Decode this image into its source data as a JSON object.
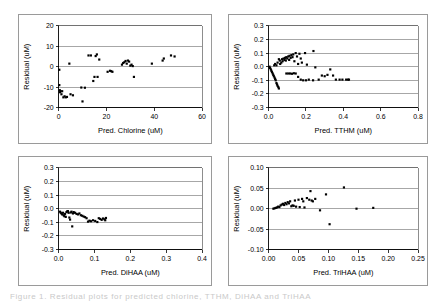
{
  "figure": {
    "background": "#ffffff",
    "marker_color": "#000000",
    "grid_color": "#7f7f7f",
    "axis_color": "#000000",
    "caption_partial": "Figure 1. Residual plots for predicted chlorine, TTHM, DiHAA and TriHAA"
  },
  "chart_data": [
    {
      "id": "chlorine",
      "position": "top-left",
      "type": "scatter",
      "title": "",
      "xlabel": "Pred. Chlorine (uM)",
      "ylabel": "Residual (uM)",
      "xlim": [
        0,
        60
      ],
      "ylim": [
        -20,
        20
      ],
      "xticks": [
        0,
        20,
        40,
        60
      ],
      "xtick_labels": [
        "0",
        "20",
        "40",
        "60"
      ],
      "yticks": [
        -20,
        -10,
        0,
        10,
        20
      ],
      "ytick_labels": [
        "-20",
        "-10",
        "0",
        "10",
        "20"
      ],
      "grid": true,
      "legend": "none",
      "points": [
        [
          0.3,
          -1.5
        ],
        [
          0.3,
          -9.0
        ],
        [
          0.5,
          -11.5
        ],
        [
          0.6,
          -12.5
        ],
        [
          0.8,
          -12.0
        ],
        [
          1.2,
          -13.5
        ],
        [
          1.5,
          -12.0
        ],
        [
          2.0,
          -15.0
        ],
        [
          2.5,
          -14.5
        ],
        [
          3.0,
          -15.0
        ],
        [
          3.5,
          -14.8
        ],
        [
          4.5,
          1.5
        ],
        [
          5.0,
          -13.5
        ],
        [
          6.0,
          -14.0
        ],
        [
          9.5,
          -10.2
        ],
        [
          10.0,
          -17.0
        ],
        [
          11.0,
          -10.3
        ],
        [
          12.5,
          5.5
        ],
        [
          13.5,
          5.5
        ],
        [
          14.5,
          -7.0
        ],
        [
          15.0,
          -5.0
        ],
        [
          15.5,
          5.2
        ],
        [
          16.0,
          6.0
        ],
        [
          16.3,
          -5.0
        ],
        [
          17.0,
          3.5
        ],
        [
          20.5,
          -2.5
        ],
        [
          21.5,
          -2.0
        ],
        [
          22.0,
          -2.2
        ],
        [
          22.5,
          -2.5
        ],
        [
          26.5,
          1.0
        ],
        [
          27.0,
          1.8
        ],
        [
          27.5,
          2.2
        ],
        [
          28.0,
          2.8
        ],
        [
          28.5,
          1.5
        ],
        [
          29.0,
          3.0
        ],
        [
          29.5,
          2.5
        ],
        [
          30.0,
          0.5
        ],
        [
          30.5,
          1.0
        ],
        [
          31.0,
          0.3
        ],
        [
          31.5,
          -5.0
        ],
        [
          39.0,
          1.5
        ],
        [
          43.5,
          3.0
        ],
        [
          44.0,
          4.0
        ],
        [
          47.0,
          5.5
        ],
        [
          48.5,
          5.0
        ]
      ]
    },
    {
      "id": "tthm",
      "position": "top-right",
      "type": "scatter",
      "title": "",
      "xlabel": "Pred. TTHM (uM)",
      "ylabel": "Residual (uM)",
      "xlim": [
        0.0,
        0.8
      ],
      "ylim": [
        -0.3,
        0.3
      ],
      "xticks": [
        0.0,
        0.2,
        0.4,
        0.6,
        0.8
      ],
      "xtick_labels": [
        "0.0",
        "0.2",
        "0.4",
        "0.6",
        "0.8"
      ],
      "yticks": [
        -0.3,
        -0.2,
        -0.1,
        0.0,
        0.1,
        0.2,
        0.3
      ],
      "ytick_labels": [
        "-0.3",
        "-0.2",
        "-0.1",
        "0.0",
        "0.1",
        "0.2",
        "0.3"
      ],
      "grid": true,
      "legend": "none",
      "points": [
        [
          0.005,
          0.0
        ],
        [
          0.008,
          -0.01
        ],
        [
          0.012,
          -0.02
        ],
        [
          0.015,
          -0.03
        ],
        [
          0.018,
          -0.04
        ],
        [
          0.022,
          -0.05
        ],
        [
          0.025,
          -0.06
        ],
        [
          0.028,
          -0.07
        ],
        [
          0.032,
          -0.08
        ],
        [
          0.035,
          -0.09
        ],
        [
          0.038,
          -0.1
        ],
        [
          0.042,
          -0.12
        ],
        [
          0.045,
          -0.13
        ],
        [
          0.048,
          -0.14
        ],
        [
          0.052,
          -0.15
        ],
        [
          0.055,
          -0.16
        ],
        [
          0.03,
          0.01
        ],
        [
          0.035,
          0.02
        ],
        [
          0.042,
          0.01
        ],
        [
          0.048,
          0.03
        ],
        [
          0.055,
          0.055
        ],
        [
          0.06,
          0.045
        ],
        [
          0.062,
          0.02
        ],
        [
          0.068,
          0.03
        ],
        [
          0.072,
          0.055
        ],
        [
          0.075,
          0.04
        ],
        [
          0.08,
          0.06
        ],
        [
          0.085,
          0.05
        ],
        [
          0.088,
          0.065
        ],
        [
          0.092,
          0.045
        ],
        [
          0.095,
          0.07
        ],
        [
          0.1,
          0.06
        ],
        [
          0.105,
          0.075
        ],
        [
          0.11,
          0.05
        ],
        [
          0.112,
          0.08
        ],
        [
          0.118,
          0.065
        ],
        [
          0.122,
          0.085
        ],
        [
          0.128,
          0.07
        ],
        [
          0.132,
          0.09
        ],
        [
          0.138,
          0.04
        ],
        [
          0.145,
          0.1
        ],
        [
          0.152,
          0.075
        ],
        [
          0.158,
          0.02
        ],
        [
          0.165,
          0.095
        ],
        [
          0.172,
          0.06
        ],
        [
          0.178,
          0.03
        ],
        [
          0.195,
          0.1
        ],
        [
          0.205,
          0.015
        ],
        [
          0.24,
          0.115
        ],
        [
          0.25,
          -0.005
        ],
        [
          0.095,
          -0.05
        ],
        [
          0.105,
          -0.05
        ],
        [
          0.115,
          -0.05
        ],
        [
          0.125,
          -0.052
        ],
        [
          0.135,
          -0.048
        ],
        [
          0.145,
          -0.05
        ],
        [
          0.158,
          -0.075
        ],
        [
          0.172,
          -0.095
        ],
        [
          0.185,
          -0.1
        ],
        [
          0.2,
          -0.1
        ],
        [
          0.215,
          -0.095
        ],
        [
          0.238,
          -0.1
        ],
        [
          0.268,
          -0.095
        ],
        [
          0.285,
          -0.065
        ],
        [
          0.3,
          -0.07
        ],
        [
          0.315,
          -0.06
        ],
        [
          0.33,
          -0.02
        ],
        [
          0.345,
          -0.065
        ],
        [
          0.36,
          -0.095
        ],
        [
          0.38,
          -0.095
        ],
        [
          0.395,
          -0.095
        ],
        [
          0.415,
          -0.095
        ],
        [
          0.425,
          -0.095
        ],
        [
          0.43,
          -0.095
        ]
      ]
    },
    {
      "id": "dihaa",
      "position": "bottom-left",
      "type": "scatter",
      "title": "",
      "xlabel": "Pred. DiHAA (uM)",
      "ylabel": "Residual (uM)",
      "xlim": [
        0.0,
        0.4
      ],
      "ylim": [
        -0.3,
        0.3
      ],
      "xticks": [
        0.0,
        0.1,
        0.2,
        0.3,
        0.4
      ],
      "xtick_labels": [
        "0.0",
        "0.1",
        "0.2",
        "0.3",
        "0.4"
      ],
      "yticks": [
        -0.3,
        -0.2,
        -0.1,
        0.0,
        0.1,
        0.2,
        0.3
      ],
      "ytick_labels": [
        "-0.3",
        "-0.2",
        "-0.1",
        "0.0",
        "0.1",
        "0.2",
        "0.3"
      ],
      "grid": true,
      "legend": "none",
      "points": [
        [
          0.004,
          -0.022
        ],
        [
          0.006,
          -0.03
        ],
        [
          0.008,
          -0.035
        ],
        [
          0.01,
          -0.042
        ],
        [
          0.012,
          -0.03
        ],
        [
          0.014,
          -0.048
        ],
        [
          0.016,
          -0.055
        ],
        [
          0.018,
          -0.038
        ],
        [
          0.02,
          -0.06
        ],
        [
          0.022,
          -0.025
        ],
        [
          0.024,
          -0.02
        ],
        [
          0.026,
          -0.018
        ],
        [
          0.028,
          -0.03
        ],
        [
          0.03,
          -0.065
        ],
        [
          0.032,
          -0.08
        ],
        [
          0.034,
          -0.028
        ],
        [
          0.036,
          -0.022
        ],
        [
          0.038,
          -0.13
        ],
        [
          0.04,
          -0.035
        ],
        [
          0.042,
          -0.025
        ],
        [
          0.046,
          -0.03
        ],
        [
          0.05,
          -0.038
        ],
        [
          0.054,
          -0.042
        ],
        [
          0.058,
          -0.035
        ],
        [
          0.062,
          -0.048
        ],
        [
          0.066,
          -0.052
        ],
        [
          0.07,
          -0.058
        ],
        [
          0.074,
          -0.062
        ],
        [
          0.078,
          -0.07
        ],
        [
          0.082,
          -0.095
        ],
        [
          0.086,
          -0.088
        ],
        [
          0.09,
          -0.092
        ],
        [
          0.096,
          -0.085
        ],
        [
          0.102,
          -0.09
        ],
        [
          0.108,
          -0.098
        ],
        [
          0.112,
          -0.07
        ],
        [
          0.116,
          -0.075
        ],
        [
          0.12,
          -0.082
        ],
        [
          0.124,
          -0.072
        ],
        [
          0.128,
          -0.078
        ],
        [
          0.13,
          -0.085
        ],
        [
          0.132,
          -0.068
        ]
      ]
    },
    {
      "id": "trihaa",
      "position": "bottom-right",
      "type": "scatter",
      "title": "",
      "xlabel": "Pred. TriHAA (uM)",
      "ylabel": "Residual (uM)",
      "xlim": [
        0.0,
        0.25
      ],
      "ylim": [
        -0.1,
        0.1
      ],
      "xticks": [
        0.0,
        0.05,
        0.1,
        0.15,
        0.2,
        0.25
      ],
      "xtick_labels": [
        "0.00",
        "0.05",
        "0.10",
        "0.15",
        "0.20",
        "0.25"
      ],
      "yticks": [
        -0.1,
        -0.05,
        0.0,
        0.05,
        0.1
      ],
      "ytick_labels": [
        "-0.10",
        "-0.05",
        "0.00",
        "0.05",
        "0.10"
      ],
      "grid": true,
      "legend": "none",
      "points": [
        [
          0.008,
          0.0
        ],
        [
          0.01,
          0.001
        ],
        [
          0.012,
          0.002
        ],
        [
          0.014,
          0.003
        ],
        [
          0.016,
          0.005
        ],
        [
          0.018,
          0.004
        ],
        [
          0.02,
          0.008
        ],
        [
          0.022,
          0.01
        ],
        [
          0.024,
          0.012
        ],
        [
          0.026,
          0.009
        ],
        [
          0.028,
          0.014
        ],
        [
          0.03,
          0.011
        ],
        [
          0.032,
          0.016
        ],
        [
          0.034,
          0.013
        ],
        [
          0.036,
          0.018
        ],
        [
          0.038,
          0.006
        ],
        [
          0.04,
          0.008
        ],
        [
          0.042,
          0.007
        ],
        [
          0.044,
          0.02
        ],
        [
          0.046,
          0.005
        ],
        [
          0.05,
          0.022
        ],
        [
          0.052,
          0.004
        ],
        [
          0.056,
          0.024
        ],
        [
          0.058,
          0.018
        ],
        [
          0.06,
          0.003
        ],
        [
          0.064,
          0.026
        ],
        [
          0.068,
          0.022
        ],
        [
          0.07,
          0.043
        ],
        [
          0.072,
          0.02
        ],
        [
          0.074,
          0.018
        ],
        [
          0.078,
          0.024
        ],
        [
          0.086,
          -0.004
        ],
        [
          0.096,
          0.035
        ],
        [
          0.102,
          -0.038
        ],
        [
          0.126,
          0.052
        ],
        [
          0.147,
          0.0
        ],
        [
          0.175,
          0.002
        ]
      ]
    }
  ]
}
